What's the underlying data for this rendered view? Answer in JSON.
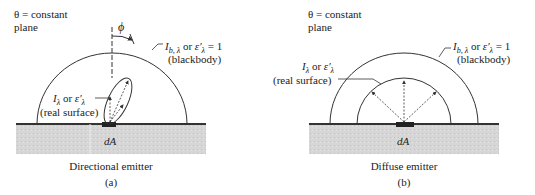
{
  "panels": [
    {
      "id": "a",
      "plane_label_line1": "θ = constant",
      "plane_label_line2": "plane",
      "angle_symbol": "ϕ",
      "blackbody_label_line1": "I b, λ or ε′λ = 1",
      "blackbody_label_line2": "(blackbody)",
      "real_label_line1": "Iλ or ε′λ",
      "real_label_line2": "(real surface)",
      "area_label": "dA",
      "caption": "Directional emitter",
      "sublabel": "(a)"
    },
    {
      "id": "b",
      "plane_label_line1": "θ = constant",
      "plane_label_line2": "plane",
      "blackbody_label_line1": "I b, λ or ε′λ = 1",
      "blackbody_label_line2": "(blackbody)",
      "real_label_line1": "Iλ or ε′λ",
      "real_label_line2": "(real surface)",
      "area_label": "dA",
      "caption": "Diffuse emitter",
      "sublabel": "(b)"
    }
  ],
  "colors": {
    "ground": "#d4d4d4",
    "line": "#333333",
    "surface": "#222222"
  }
}
